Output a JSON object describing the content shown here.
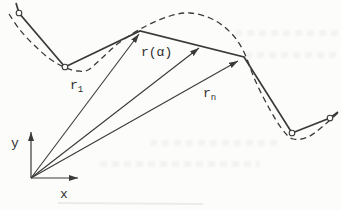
{
  "figure": {
    "labels": {
      "r1": {
        "base": "r",
        "sub": "1"
      },
      "r_alpha": {
        "text": "r(α)"
      },
      "rn": {
        "base": "r",
        "sub": "n"
      },
      "axis_x": {
        "text": "x"
      },
      "axis_y": {
        "text": "y"
      }
    },
    "colors": {
      "ink": "#3a3a3a",
      "paper": "#fcfcfb",
      "scan_artifact": "#ebebe9"
    },
    "geometry": {
      "canvas": {
        "width": 341,
        "height": 210
      },
      "dashed_curve_points": [
        [
          9,
          14
        ],
        [
          20,
          30
        ],
        [
          34,
          45
        ],
        [
          50,
          59
        ],
        [
          66,
          68
        ],
        [
          78,
          71
        ],
        [
          88,
          70
        ],
        [
          102,
          58
        ],
        [
          120,
          42
        ],
        [
          146,
          26
        ],
        [
          170,
          16
        ],
        [
          190,
          13
        ],
        [
          212,
          19
        ],
        [
          230,
          32
        ],
        [
          243,
          50
        ],
        [
          255,
          80
        ],
        [
          269,
          108
        ],
        [
          282,
          129
        ],
        [
          293,
          139
        ],
        [
          308,
          137
        ],
        [
          322,
          127
        ],
        [
          339,
          112
        ]
      ],
      "dash_pattern": "6 4",
      "chord_polyline": [
        [
          16,
          3
        ],
        [
          19,
          13
        ],
        [
          65,
          67
        ],
        [
          140,
          31
        ],
        [
          244,
          57
        ],
        [
          292,
          133
        ],
        [
          330,
          118
        ],
        [
          338,
          112
        ]
      ],
      "node_circles": [
        [
          19,
          13
        ],
        [
          65,
          67
        ],
        [
          292,
          133
        ],
        [
          330,
          118
        ]
      ],
      "node_radius": 2.8,
      "vectors": [
        {
          "name": "r1",
          "from": [
            31,
            178
          ],
          "to": [
            139,
            34
          ]
        },
        {
          "name": "r-alpha",
          "from": [
            31,
            178
          ],
          "to": [
            199,
            48
          ]
        },
        {
          "name": "rn",
          "from": [
            31,
            178
          ],
          "to": [
            238,
            61
          ]
        }
      ],
      "axes": {
        "origin": [
          31,
          178
        ],
        "x_tip": [
          78,
          178
        ],
        "y_tip": [
          31,
          132
        ]
      },
      "scan_line": {
        "x1": 58,
        "y1": 203,
        "x2": 203,
        "y2": 204
      }
    }
  }
}
